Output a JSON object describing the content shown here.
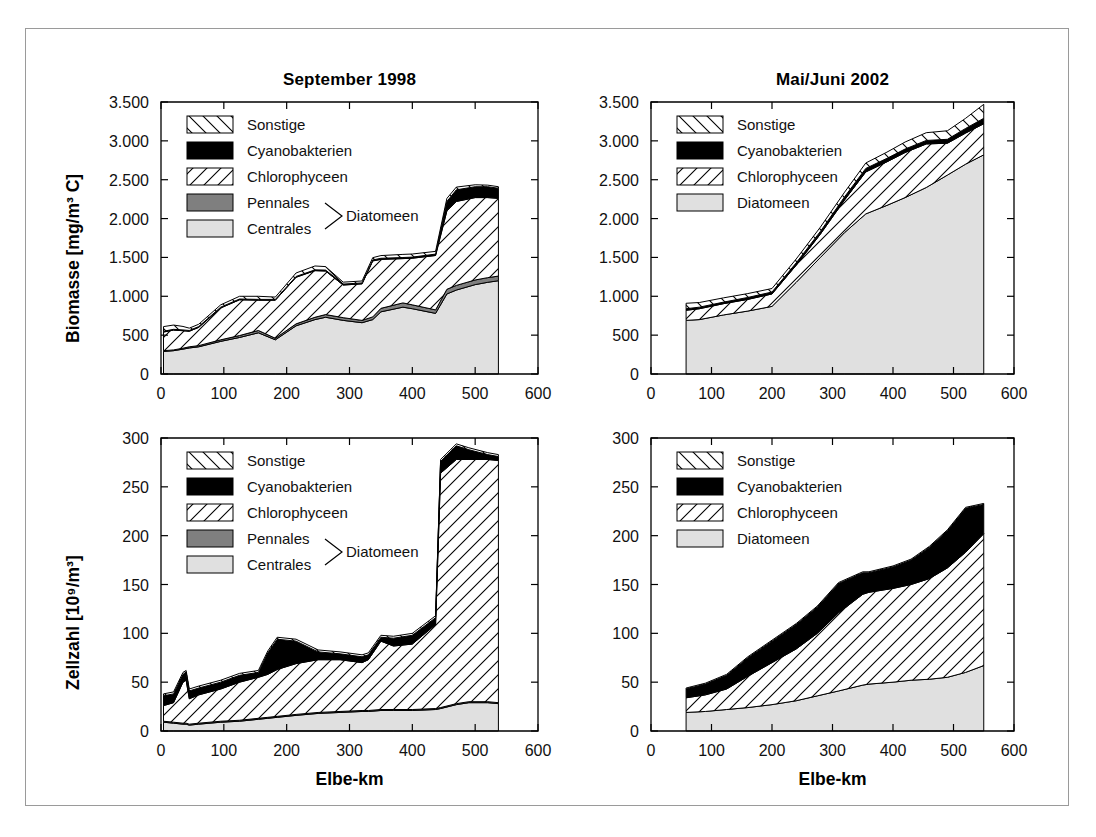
{
  "figure": {
    "panels": [
      {
        "key": "biomasse_1998",
        "title": "September 1998",
        "ylabel": "Biomasse [mg/m³ C]",
        "xlabel": "Elbe-km",
        "legend_style": "five"
      },
      {
        "key": "biomasse_2002",
        "title": "Mai/Juni 2002",
        "ylabel": "",
        "xlabel": "Elbe-km",
        "legend_style": "four"
      },
      {
        "key": "zellzahl_1998",
        "title": "",
        "ylabel": "Zellzahl [10⁹/m³]",
        "xlabel": "Elbe-km",
        "legend_style": "five"
      },
      {
        "key": "zellzahl_2002",
        "title": "",
        "ylabel": "",
        "xlabel": "Elbe-km",
        "legend_style": "four"
      }
    ],
    "legend_five": {
      "items": [
        {
          "label": "Sonstige",
          "fill": "hatch-back"
        },
        {
          "label": "Cyanobakterien",
          "fill": "solid-black"
        },
        {
          "label": "Chlorophyceen",
          "fill": "hatch-fwd"
        },
        {
          "label": "Pennales",
          "fill": "solid-darkgray"
        },
        {
          "label": "Centrales",
          "fill": "solid-lightgray"
        }
      ],
      "group_label": "Diatomeen",
      "group_members": [
        "Pennales",
        "Centrales"
      ]
    },
    "legend_four": {
      "items": [
        {
          "label": "Sonstige",
          "fill": "hatch-back"
        },
        {
          "label": "Cyanobakterien",
          "fill": "solid-black"
        },
        {
          "label": "Chlorophyceen",
          "fill": "hatch-fwd"
        },
        {
          "label": "Diatomeen",
          "fill": "solid-lightgray"
        }
      ],
      "group_label": "",
      "group_members": []
    },
    "colors": {
      "black": "#000000",
      "dark_gray": "#7f7f7f",
      "light_gray": "#e0e0e0",
      "white": "#ffffff",
      "frame": "#000000",
      "border": "#9a9a9a"
    }
  },
  "chart_data": [
    {
      "type": "area",
      "key": "biomasse_1998",
      "title": "September 1998",
      "xlabel": "Elbe-km",
      "ylabel": "Biomasse [mg/m³ C]",
      "xlim": [
        0,
        600
      ],
      "ylim": [
        0,
        3500
      ],
      "xticks": [
        0,
        100,
        200,
        300,
        400,
        500,
        600
      ],
      "yticks": [
        0,
        500,
        1000,
        1500,
        2000,
        2500,
        3000,
        3500
      ],
      "ytick_labels": [
        "0",
        "500",
        "1.000",
        "1.500",
        "2.000",
        "2.500",
        "3.000",
        "3.500"
      ],
      "xtick_labels": [
        "0",
        "100",
        "200",
        "300",
        "400",
        "500",
        "600"
      ],
      "grid": false,
      "legend_position": "upper-left",
      "stacked": true,
      "x": [
        4,
        20,
        35,
        45,
        60,
        95,
        125,
        155,
        182,
        215,
        245,
        262,
        290,
        320,
        337,
        350,
        385,
        400,
        437,
        455,
        470,
        500,
        520,
        537
      ],
      "series": [
        {
          "name": "Centrales",
          "values": [
            290,
            300,
            320,
            335,
            350,
            420,
            470,
            530,
            440,
            620,
            700,
            730,
            690,
            660,
            700,
            800,
            860,
            840,
            780,
            1030,
            1080,
            1150,
            1180,
            1200
          ]
        },
        {
          "name": "Pennales",
          "values": [
            10,
            10,
            12,
            15,
            15,
            20,
            25,
            30,
            20,
            25,
            30,
            35,
            35,
            30,
            35,
            45,
            55,
            50,
            45,
            60,
            60,
            60,
            60,
            60
          ]
        },
        {
          "name": "Chlorophyceen",
          "values": [
            240,
            255,
            225,
            200,
            235,
            410,
            460,
            390,
            490,
            600,
            600,
            560,
            420,
            470,
            720,
            630,
            570,
            600,
            700,
            1010,
            1080,
            1060,
            1030,
            1000
          ]
        },
        {
          "name": "Cyanobakterien",
          "values": [
            10,
            10,
            10,
            10,
            10,
            10,
            10,
            10,
            10,
            10,
            10,
            12,
            12,
            12,
            12,
            14,
            14,
            14,
            18,
            120,
            150,
            140,
            140,
            130
          ]
        },
        {
          "name": "Sonstige",
          "values": [
            60,
            55,
            45,
            30,
            30,
            30,
            35,
            40,
            30,
            45,
            50,
            45,
            25,
            25,
            30,
            35,
            40,
            40,
            35,
            40,
            35,
            25,
            20,
            20
          ]
        }
      ]
    },
    {
      "type": "area",
      "key": "biomasse_2002",
      "title": "Mai/Juni 2002",
      "xlabel": "Elbe-km",
      "ylabel": "Biomasse [mg/m³ C]",
      "xlim": [
        0,
        600
      ],
      "ylim": [
        0,
        3500
      ],
      "xticks": [
        0,
        100,
        200,
        300,
        400,
        500,
        600
      ],
      "yticks": [
        0,
        500,
        1000,
        1500,
        2000,
        2500,
        3000,
        3500
      ],
      "ytick_labels": [
        "0",
        "500",
        "1.000",
        "1.500",
        "2.000",
        "2.500",
        "3.000",
        "3.500"
      ],
      "xtick_labels": [
        "0",
        "100",
        "200",
        "300",
        "400",
        "500",
        "600"
      ],
      "grid": false,
      "legend_position": "upper-left",
      "stacked": true,
      "x": [
        58,
        80,
        120,
        160,
        200,
        240,
        280,
        320,
        355,
        390,
        420,
        455,
        490,
        520,
        550
      ],
      "series": [
        {
          "name": "Diatomeen",
          "values": [
            690,
            700,
            760,
            810,
            870,
            1180,
            1500,
            1820,
            2060,
            2170,
            2270,
            2400,
            2560,
            2700,
            2820
          ]
        },
        {
          "name": "Chlorophyceen",
          "values": [
            130,
            140,
            145,
            150,
            160,
            220,
            300,
            420,
            540,
            560,
            580,
            560,
            410,
            400,
            400
          ]
        },
        {
          "name": "Cyanobakterien",
          "values": [
            20,
            20,
            20,
            25,
            25,
            30,
            35,
            40,
            45,
            45,
            45,
            45,
            50,
            60,
            70
          ]
        },
        {
          "name": "Sonstige",
          "values": [
            70,
            60,
            55,
            50,
            45,
            50,
            55,
            60,
            70,
            80,
            90,
            100,
            110,
            130,
            180
          ]
        }
      ]
    },
    {
      "type": "area",
      "key": "zellzahl_1998",
      "title": "September 1998",
      "xlabel": "Elbe-km",
      "ylabel": "Zellzahl [10⁹/m³]",
      "xlim": [
        0,
        600
      ],
      "ylim": [
        0,
        300
      ],
      "xticks": [
        0,
        100,
        200,
        300,
        400,
        500,
        600
      ],
      "yticks": [
        0,
        50,
        100,
        150,
        200,
        250,
        300
      ],
      "ytick_labels": [
        "0",
        "50",
        "100",
        "150",
        "200",
        "250",
        "300"
      ],
      "xtick_labels": [
        "0",
        "100",
        "200",
        "300",
        "400",
        "500",
        "600"
      ],
      "grid": false,
      "legend_position": "upper-left",
      "stacked": true,
      "x": [
        4,
        20,
        35,
        40,
        45,
        60,
        95,
        125,
        155,
        170,
        185,
        215,
        250,
        285,
        320,
        330,
        350,
        370,
        400,
        437,
        445,
        470,
        490,
        520,
        537
      ],
      "series": [
        {
          "name": "Centrales",
          "values": [
            9,
            8,
            7,
            7,
            6,
            7,
            9,
            10,
            12,
            13,
            14,
            16,
            18,
            19,
            20,
            20,
            21,
            21,
            21,
            22,
            23,
            27,
            29,
            29,
            28
          ]
        },
        {
          "name": "Pennales",
          "values": [
            1,
            1,
            1,
            1,
            1,
            1,
            1,
            1,
            1,
            1,
            1,
            1,
            1,
            1,
            1,
            1,
            1,
            1,
            1,
            1,
            1,
            1,
            1,
            1,
            1
          ]
        },
        {
          "name": "Chlorophyceen",
          "values": [
            16,
            20,
            42,
            44,
            26,
            29,
            33,
            39,
            42,
            44,
            48,
            52,
            54,
            53,
            49,
            52,
            70,
            65,
            67,
            86,
            240,
            250,
            248,
            248,
            248
          ]
        },
        {
          "name": "Cyanobakterien",
          "values": [
            10,
            9,
            8,
            8,
            8,
            7,
            7,
            7,
            5,
            22,
            31,
            23,
            8,
            6,
            6,
            5,
            4,
            8,
            9,
            7,
            12,
            14,
            10,
            5,
            4
          ]
        },
        {
          "name": "Sonstige",
          "values": [
            2,
            2,
            2,
            2,
            2,
            2,
            2,
            2,
            2,
            2,
            2,
            2,
            2,
            2,
            2,
            2,
            2,
            2,
            2,
            2,
            2,
            2,
            2,
            2,
            2
          ]
        }
      ]
    },
    {
      "type": "area",
      "key": "zellzahl_2002",
      "title": "Mai/Juni 2002",
      "xlabel": "Elbe-km",
      "ylabel": "Zellzahl [10⁹/m³]",
      "xlim": [
        0,
        600
      ],
      "ylim": [
        0,
        300
      ],
      "xticks": [
        0,
        100,
        200,
        300,
        400,
        500,
        600
      ],
      "yticks": [
        0,
        50,
        100,
        150,
        200,
        250,
        300
      ],
      "ytick_labels": [
        "0",
        "50",
        "100",
        "150",
        "200",
        "250",
        "300"
      ],
      "xtick_labels": [
        "0",
        "100",
        "200",
        "300",
        "400",
        "500",
        "600"
      ],
      "grid": false,
      "legend_position": "upper-left",
      "stacked": true,
      "x": [
        58,
        90,
        125,
        160,
        200,
        240,
        275,
        310,
        350,
        360,
        400,
        430,
        460,
        490,
        520,
        550
      ],
      "series": [
        {
          "name": "Diatomeen",
          "values": [
            19,
            20,
            22,
            24,
            27,
            31,
            36,
            41,
            47,
            48,
            50,
            52,
            53,
            55,
            60,
            67
          ]
        },
        {
          "name": "Chlorophyceen",
          "values": [
            15,
            17,
            21,
            32,
            43,
            53,
            64,
            80,
            93,
            94,
            96,
            98,
            103,
            112,
            123,
            135
          ]
        },
        {
          "name": "Cyanobakterien",
          "values": [
            9,
            11,
            14,
            19,
            22,
            25,
            27,
            30,
            22,
            20,
            22,
            25,
            32,
            38,
            45,
            30
          ]
        },
        {
          "name": "Sonstige",
          "values": [
            1,
            1,
            1,
            1,
            1,
            1,
            1,
            1,
            1,
            1,
            1,
            1,
            1,
            1,
            1,
            1
          ]
        }
      ]
    }
  ]
}
